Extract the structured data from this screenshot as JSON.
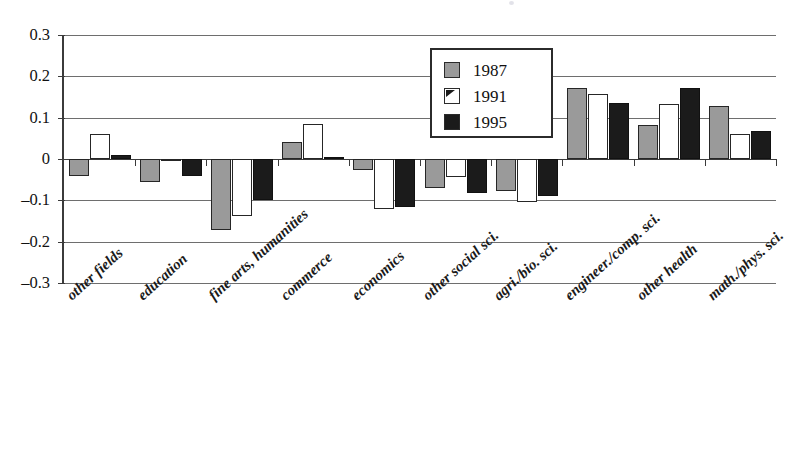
{
  "chart_data": {
    "type": "bar",
    "title": "",
    "xlabel": "",
    "ylabel": "",
    "ylim": [
      -0.3,
      0.3
    ],
    "yticks": [
      0.3,
      0.2,
      0.1,
      0,
      -0.1,
      -0.2,
      -0.3
    ],
    "ytick_labels": [
      "0.3",
      "0.2",
      "0.1",
      "0",
      "–0.1",
      "–0.2",
      "–0.3"
    ],
    "grid": true,
    "legend_position": "inside-top-center",
    "categories": [
      "other fields",
      "education",
      "fine arts, humanities",
      "commerce",
      "economics",
      "other social  sci.",
      "agri./bio. sci.",
      "engineer./comp. sci.",
      "other health",
      "math./phys. sci."
    ],
    "series": [
      {
        "name": "1987",
        "color": "#9a9a9a",
        "values": [
          -0.042,
          -0.055,
          -0.172,
          0.041,
          -0.026,
          -0.07,
          -0.078,
          0.172,
          0.083,
          0.128
        ]
      },
      {
        "name": "1991",
        "color": "#ffffff",
        "values": [
          0.06,
          -0.005,
          -0.137,
          0.085,
          -0.12,
          -0.043,
          -0.103,
          0.158,
          0.134,
          0.06
        ]
      },
      {
        "name": "1995",
        "color": "#1b1b1b",
        "values": [
          0.01,
          -0.04,
          -0.098,
          0.006,
          -0.115,
          -0.083,
          -0.089,
          0.135,
          0.171,
          0.067
        ]
      }
    ]
  },
  "legend": {
    "items": [
      {
        "label": "1987"
      },
      {
        "label": "1991"
      },
      {
        "label": "1995"
      }
    ]
  }
}
